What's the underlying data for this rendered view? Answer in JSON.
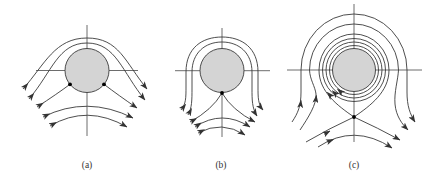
{
  "figure": {
    "panels": [
      {
        "id": "a",
        "label": "(a)"
      },
      {
        "id": "b",
        "label": "(b)"
      },
      {
        "id": "c",
        "label": "(c)"
      }
    ]
  },
  "colors": {
    "background": "#ffffff",
    "streamline": "#3a3a3a",
    "axis": "#474747",
    "cylinder_fill": "#d4d4d4",
    "stagnation_point": "#000000",
    "label": "#333333"
  },
  "icons": {
    "arrowhead": "flow-direction-arrowhead",
    "stagnation_point": "filled-dot"
  }
}
